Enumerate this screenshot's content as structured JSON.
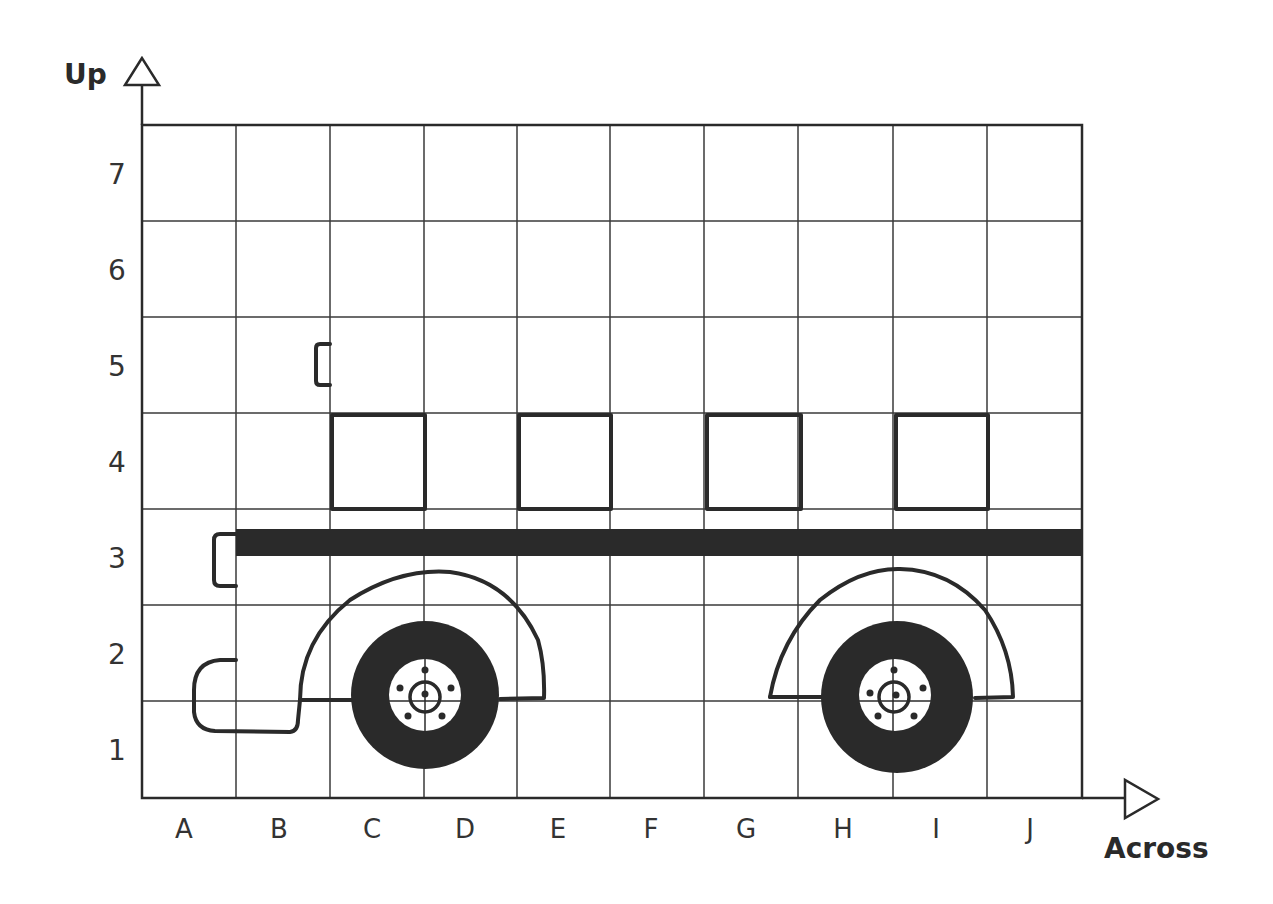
{
  "diagram": {
    "type": "coordinate-grid-worksheet",
    "y_axis_title": "Up",
    "x_axis_title": "Across",
    "columns": [
      "A",
      "B",
      "C",
      "D",
      "E",
      "F",
      "G",
      "H",
      "I",
      "J"
    ],
    "rows": [
      "1",
      "2",
      "3",
      "4",
      "5",
      "6",
      "7"
    ],
    "colors": {
      "ink": "#2a2a2a",
      "grid": "#3a3a3a",
      "background": "#ffffff"
    },
    "shapes": [
      {
        "name": "window",
        "col_from": "C",
        "col_to": "C",
        "row": "4"
      },
      {
        "name": "window",
        "col_from": "E",
        "col_to": "E",
        "row": "4"
      },
      {
        "name": "window",
        "col_from": "G",
        "col_to": "G",
        "row": "4"
      },
      {
        "name": "window",
        "col_from": "I",
        "col_to": "I",
        "row": "4"
      },
      {
        "name": "roof-bar",
        "from": "B3",
        "to": "J3"
      },
      {
        "name": "bracket",
        "at": "B5/C5"
      },
      {
        "name": "bracket",
        "at": "A3/B3"
      },
      {
        "name": "front-wheel",
        "at": "C1/D1"
      },
      {
        "name": "rear-wheel",
        "at": "H1/I1"
      },
      {
        "name": "front-bumper",
        "at": "A1/B1"
      }
    ]
  }
}
